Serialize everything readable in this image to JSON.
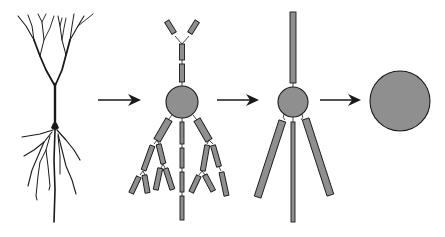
{
  "diagram": {
    "colors": {
      "background": "#ffffff",
      "stroke": "#1a1a1a",
      "compartment_fill": "#8f8f8f"
    },
    "stages": [
      {
        "id": "neuron-morphology",
        "kind": "drawing"
      },
      {
        "id": "multi-compartment-model",
        "kind": "model",
        "soma": {
          "cx": 182,
          "cy": 102,
          "r": 16
        }
      },
      {
        "id": "reduced-compartment-model",
        "kind": "model",
        "soma": {
          "cx": 293,
          "cy": 102,
          "r": 15
        }
      },
      {
        "id": "single-compartment-model",
        "kind": "model",
        "soma": {
          "cx": 400,
          "cy": 101,
          "r": 30
        }
      }
    ],
    "arrows": [
      {
        "from": "neuron-morphology",
        "to": "multi-compartment-model",
        "x1": 98,
        "x2": 141,
        "y": 100
      },
      {
        "from": "multi-compartment-model",
        "to": "reduced-compartment-model",
        "x1": 217,
        "x2": 259,
        "y": 100
      },
      {
        "from": "reduced-compartment-model",
        "to": "single-compartment-model",
        "x1": 320,
        "x2": 361,
        "y": 100
      }
    ]
  }
}
